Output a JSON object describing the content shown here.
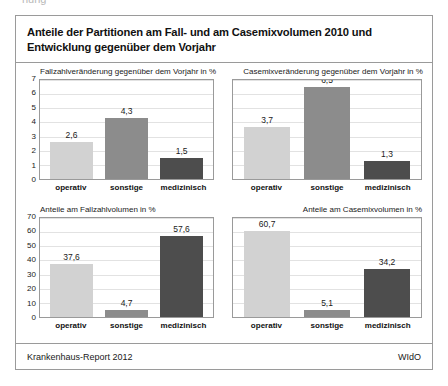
{
  "artifact": {
    "text": "nung"
  },
  "figure": {
    "title": "Anteile der Partitionen am Fall- und am Casemixvolumen 2010 und Entwicklung gegenüber dem Vorjahr",
    "footer_left": "Krankenhaus-Report 2012",
    "footer_right": "WIdO"
  },
  "colors": {
    "operativ": "#d2d2d2",
    "sonstige": "#8c8c8c",
    "medizinisch": "#4d4d4d",
    "frame": "#9a9a9a",
    "gridline": "#e2e2e2"
  },
  "chart_data": [
    {
      "type": "bar",
      "title": "Fallzahlveränderung gegenüber dem Vorjahr in %",
      "categories": [
        "operativ",
        "sonstige",
        "medizinisch"
      ],
      "values": [
        2.6,
        4.3,
        1.5
      ],
      "labels": [
        "2,6",
        "4,3",
        "1,5"
      ],
      "yticks": [
        "0",
        "1",
        "2",
        "3",
        "4",
        "5",
        "6",
        "7"
      ],
      "ylim": [
        0,
        7
      ],
      "show_yticks": true,
      "title_align": "left",
      "xlabel": "",
      "ylabel": "",
      "grid": true
    },
    {
      "type": "bar",
      "title": "Casemixveränderung gegenüber dem Vorjahr in %",
      "categories": [
        "operativ",
        "sonstige",
        "medizinisch"
      ],
      "values": [
        3.7,
        6.5,
        1.3
      ],
      "labels": [
        "3,7",
        "6,5",
        "1,3"
      ],
      "yticks": [],
      "ylim": [
        0,
        7
      ],
      "show_yticks": false,
      "title_align": "center",
      "xlabel": "",
      "ylabel": "",
      "grid": true
    },
    {
      "type": "bar",
      "title": "Anteile am Fallzahlvolumen in %",
      "categories": [
        "operativ",
        "sonstige",
        "medizinisch"
      ],
      "values": [
        37.6,
        4.7,
        57.6
      ],
      "labels": [
        "37,6",
        "4,7",
        "57,6"
      ],
      "yticks": [
        "0",
        "10",
        "20",
        "30",
        "40",
        "50",
        "60",
        "70"
      ],
      "ylim": [
        0,
        70
      ],
      "show_yticks": true,
      "title_align": "left",
      "xlabel": "",
      "ylabel": "",
      "grid": true
    },
    {
      "type": "bar",
      "title": "Anteile am Casemixvolumen in %",
      "categories": [
        "operativ",
        "sonstige",
        "medizinisch"
      ],
      "values": [
        60.7,
        5.1,
        34.2
      ],
      "labels": [
        "60,7",
        "5,1",
        "34,2"
      ],
      "yticks": [],
      "ylim": [
        0,
        70
      ],
      "show_yticks": false,
      "title_align": "right",
      "xlabel": "",
      "ylabel": "",
      "grid": true
    }
  ]
}
